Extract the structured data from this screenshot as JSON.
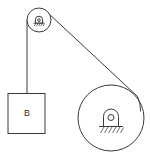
{
  "figure": {
    "background_color": "#ffffff",
    "line_color": "#3a3a3a",
    "labels": {
      "block_label": "B"
    },
    "components": {
      "top_pulley": {
        "name": "small pulley",
        "center_x": 39,
        "center_y": 20,
        "radius": 12,
        "hub_symbol": "pin-support-with-hatching"
      },
      "large_wheel": {
        "name": "large wheel",
        "center_x": 111,
        "center_y": 118,
        "radius": 33,
        "hub_symbol": "pin-support-with-hatching"
      },
      "block": {
        "name": "hanging block B",
        "x": 8,
        "y": 93,
        "width": 37,
        "height": 40
      },
      "vertical_cord": {
        "name": "vertical cord",
        "from_x": 27,
        "from_y": 20,
        "to_x": 27,
        "to_y": 93
      },
      "diagonal_cord": {
        "name": "diagonal cord",
        "from_x": 47,
        "from_y": 12,
        "to_x": 137,
        "to_y": 96
      }
    }
  }
}
